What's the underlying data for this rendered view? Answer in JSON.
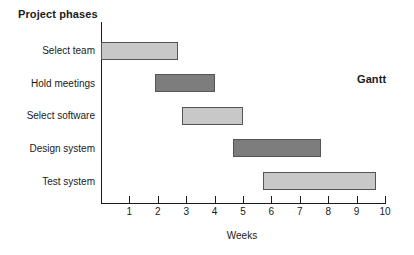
{
  "chart_title": "Project phases",
  "annotation": "Gantt",
  "axis": {
    "x_title": "Weeks",
    "x_ticks": [
      "1",
      "2",
      "3",
      "4",
      "5",
      "6",
      "7",
      "8",
      "9",
      "10"
    ]
  },
  "colors": {
    "bar_light": "#c8c8c8",
    "bar_dark": "#7d7d7d",
    "bar_border": "#555555",
    "axis": "#1a1a1a",
    "background": "#ffffff"
  },
  "chart_data": {
    "type": "bar",
    "title": "Project phases",
    "xlabel": "Weeks",
    "ylabel": "Project phases",
    "xlim": [
      0,
      10.4
    ],
    "grid": false,
    "legend": null,
    "orientation": "horizontal",
    "annotations": [
      "Gantt"
    ],
    "categories": [
      "Select team",
      "Hold meetings",
      "Select software",
      "Design system",
      "Test system"
    ],
    "tasks": [
      {
        "label": "Select team",
        "start": 0.0,
        "end": 2.7,
        "duration": 2.7,
        "shade": "light"
      },
      {
        "label": "Hold meetings",
        "start": 1.9,
        "end": 4.0,
        "duration": 2.1,
        "shade": "dark"
      },
      {
        "label": "Select software",
        "start": 2.85,
        "end": 5.0,
        "duration": 2.15,
        "shade": "light"
      },
      {
        "label": "Design system",
        "start": 4.65,
        "end": 7.75,
        "duration": 3.1,
        "shade": "dark"
      },
      {
        "label": "Test system",
        "start": 5.7,
        "end": 9.7,
        "duration": 4.0,
        "shade": "light"
      }
    ]
  }
}
